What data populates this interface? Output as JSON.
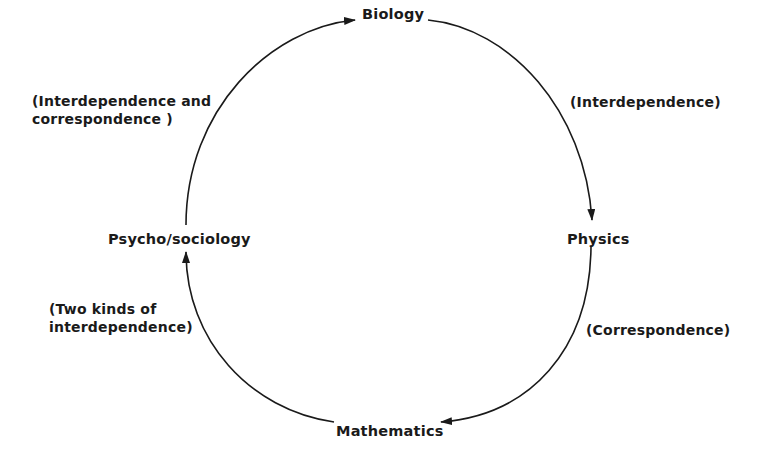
{
  "diagram": {
    "type": "cycle",
    "nodes": {
      "top": "Biology",
      "right": "Physics",
      "bottom": "Mathematics",
      "left": "Psycho/sociology"
    },
    "edges": [
      {
        "from": "Psycho/sociology",
        "to": "Biology",
        "label_lines": [
          "(Interdependence and",
          "correspondence )"
        ]
      },
      {
        "from": "Biology",
        "to": "Physics",
        "label_lines": [
          "(Interdependence)"
        ]
      },
      {
        "from": "Physics",
        "to": "Mathematics",
        "label_lines": [
          "(Correspondence)"
        ]
      },
      {
        "from": "Mathematics",
        "to": "Psycho/sociology",
        "label_lines": [
          "(Two kinds of",
          "interdependence)"
        ]
      }
    ],
    "stroke_color": "#1a1a1a",
    "background_color": "#ffffff"
  }
}
